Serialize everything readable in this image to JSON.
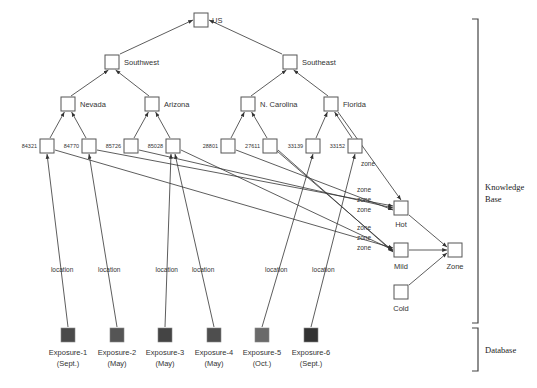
{
  "regions": {
    "knowledge_base": {
      "label_line1": "Knowledge",
      "label_line2": "Base"
    },
    "database": {
      "label": "Database"
    }
  },
  "hierarchy": {
    "root": {
      "id": "us",
      "label": "US",
      "x": 201,
      "y": 20
    },
    "regions": [
      {
        "id": "southwest",
        "label": "Southwest",
        "x": 112,
        "y": 62
      },
      {
        "id": "southeast",
        "label": "Southeast",
        "x": 290,
        "y": 62
      }
    ],
    "states": [
      {
        "id": "nevada",
        "label": "Nevada",
        "x": 68,
        "y": 104,
        "parent": "southwest"
      },
      {
        "id": "arizona",
        "label": "Arizona",
        "x": 152,
        "y": 104,
        "parent": "southwest"
      },
      {
        "id": "ncarolina",
        "label": "N. Carolina",
        "x": 248,
        "y": 104,
        "parent": "southeast"
      },
      {
        "id": "florida",
        "label": "Florida",
        "x": 331,
        "y": 104,
        "parent": "southeast"
      }
    ],
    "zips": [
      {
        "id": "z84321",
        "label": "84321",
        "x": 47,
        "y": 146,
        "parent": "nevada",
        "zone": "mild"
      },
      {
        "id": "z84770",
        "label": "84770",
        "x": 89,
        "y": 146,
        "parent": "nevada",
        "zone": "hot"
      },
      {
        "id": "z85726",
        "label": "85726",
        "x": 131,
        "y": 146,
        "parent": "arizona",
        "zone": "hot"
      },
      {
        "id": "z85028",
        "label": "85028",
        "x": 173,
        "y": 146,
        "parent": "arizona",
        "zone": "mild"
      },
      {
        "id": "z28801",
        "label": "28801",
        "x": 228,
        "y": 146,
        "parent": "ncarolina",
        "zone": "hot"
      },
      {
        "id": "z27611",
        "label": "27611",
        "x": 270,
        "y": 146,
        "parent": "ncarolina",
        "zone": "mild"
      },
      {
        "id": "z33139",
        "label": "33139",
        "x": 313,
        "y": 146,
        "parent": "florida",
        "zone": "hot"
      },
      {
        "id": "z33152",
        "label": "33152",
        "x": 355,
        "y": 146,
        "parent": "florida",
        "zone": "mild"
      }
    ],
    "zones": [
      {
        "id": "hot",
        "label": "Hot",
        "x": 401,
        "y": 208
      },
      {
        "id": "mild",
        "label": "Mild",
        "x": 401,
        "y": 250
      },
      {
        "id": "cold",
        "label": "Cold",
        "x": 401,
        "y": 292
      }
    ],
    "zone_root": {
      "id": "zone",
      "label": "Zone",
      "x": 455,
      "y": 250
    },
    "florida_zone_edge_label": "zone"
  },
  "edge_labels": {
    "zone": "zone",
    "location": "location"
  },
  "exposures": [
    {
      "id": "exp1",
      "name": "Exposure-1",
      "month": "(Sept.)",
      "x": 68,
      "y": 335,
      "color": "#4a4a4a",
      "zip": "z84321"
    },
    {
      "id": "exp2",
      "name": "Exposure-2",
      "month": "(May)",
      "x": 117,
      "y": 335,
      "color": "#555555",
      "zip": "z84770"
    },
    {
      "id": "exp3",
      "name": "Exposure-3",
      "month": "(May)",
      "x": 165,
      "y": 335,
      "color": "#444444",
      "zip": "z85028"
    },
    {
      "id": "exp4",
      "name": "Exposure-4",
      "month": "(May)",
      "x": 214,
      "y": 335,
      "color": "#4e4e4e",
      "zip": "z85028"
    },
    {
      "id": "exp5",
      "name": "Exposure-5",
      "month": "(Oct.)",
      "x": 262,
      "y": 335,
      "color": "#6a6a6a",
      "zip": "z33139"
    },
    {
      "id": "exp6",
      "name": "Exposure-6",
      "month": "(Sept.)",
      "x": 311,
      "y": 335,
      "color": "#333333",
      "zip": "z33152"
    }
  ]
}
